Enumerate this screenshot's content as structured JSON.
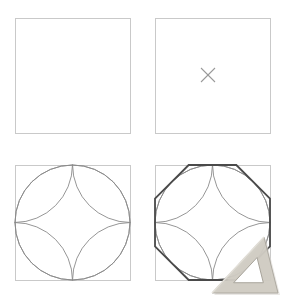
{
  "figure": {
    "background_color": "#ffffff",
    "canvas": {
      "width": 284,
      "height": 306
    },
    "panel_grid": {
      "rows": 2,
      "columns": 4
    }
  },
  "style": {
    "square_stroke_color": "#c9c9c9",
    "square_stroke_width": 1.0,
    "arc_stroke_color": "#8a8a8a",
    "arc_stroke_width": 0.9,
    "octagon_stroke_color": "#4a4a4a",
    "octagon_stroke_width": 1.8,
    "cross_stroke_color": "#9a9a9a",
    "cross_stroke_width": 1.1,
    "ruler_fill_color": "#cfcbc2",
    "ruler_edge_color": "#a8a49b",
    "ruler_highlight_color": "#e3e0d9",
    "ruler_shadow_color": "#d8d6d0"
  },
  "panels": [
    {
      "id": "panel-1",
      "step_number": "1",
      "caption": "",
      "square": {
        "x": 15,
        "y": 18,
        "size": 115
      },
      "has_cross": false,
      "has_arcs": false,
      "has_octagon": false,
      "has_ruler": false
    },
    {
      "id": "panel-2",
      "step_number": "2",
      "caption": "",
      "square": {
        "x": 155,
        "y": 18,
        "size": 115
      },
      "has_cross": true,
      "cross": {
        "cx": 208,
        "cy": 75,
        "arm": 7
      },
      "has_arcs": false,
      "has_octagon": false,
      "has_ruler": false
    },
    {
      "id": "panel-3",
      "step_number": "3",
      "caption": "",
      "square": {
        "x": 15,
        "y": 165,
        "size": 115
      },
      "has_cross": false,
      "has_arcs": true,
      "has_octagon": false,
      "has_ruler": false
    },
    {
      "id": "panel-4",
      "step_number": "4",
      "caption": "",
      "square": {
        "x": 155,
        "y": 165,
        "size": 115
      },
      "has_cross": false,
      "has_arcs": true,
      "has_octagon": true,
      "octagon_offset_ratio": 0.2929,
      "has_ruler": true,
      "ruler": {
        "name": "set-square",
        "apex": {
          "x": 264,
          "y": 237
        },
        "right_angle": {
          "x": 278,
          "y": 293
        },
        "left_corner": {
          "x": 212,
          "y": 293
        },
        "inner_inset": 9
      }
    }
  ],
  "geometry_notes": {
    "arc_description": "Four quarter-circle arcs, each centred on a square corner with radius equal to half the side, meeting at the square centre to form a four-petal rosette.",
    "octagon_description": "Regular octagon inscribed in the square; vertices sit on the square edges at the 0.2929 and 0.7071 positions.",
    "cross_description": "Small diagonal cross marking the centre of the square."
  }
}
